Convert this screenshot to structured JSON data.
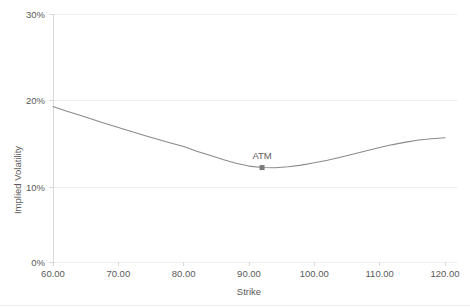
{
  "chart_data": {
    "type": "line",
    "title": "",
    "xlabel": "Strike",
    "ylabel": "Implied Volatility",
    "xlim": [
      60,
      120
    ],
    "ylim": [
      0,
      0.3
    ],
    "grid": true,
    "legend": "none",
    "x_tick_labels": [
      "60.00",
      "70.00",
      "80.00",
      "90.00",
      "100.00",
      "110.00",
      "120.00"
    ],
    "x_tick_values": [
      60,
      70,
      80,
      90,
      100,
      110,
      120
    ],
    "y_tick_labels": [
      "0%",
      "10%",
      "20%",
      "30%"
    ],
    "y_tick_values": [
      0,
      0.1,
      0.2,
      0.3
    ],
    "series": [
      {
        "name": "Implied Volatility Smile",
        "x": [
          60,
          62,
          64,
          66,
          68,
          70,
          72,
          74,
          76,
          78,
          80,
          82,
          84,
          86,
          88,
          90,
          92,
          94,
          96,
          98,
          100,
          102,
          104,
          106,
          108,
          110,
          112,
          114,
          116,
          118,
          120
        ],
        "values": [
          0.188,
          0.1828,
          0.1777,
          0.1726,
          0.1676,
          0.1627,
          0.1578,
          0.153,
          0.1484,
          0.144,
          0.1396,
          0.134,
          0.129,
          0.124,
          0.1195,
          0.116,
          0.1142,
          0.114,
          0.1152,
          0.1172,
          0.12,
          0.1232,
          0.1268,
          0.1306,
          0.1345,
          0.1384,
          0.142,
          0.145,
          0.1475,
          0.1492,
          0.1503
        ]
      }
    ],
    "annotations": [
      {
        "label": "ATM",
        "x": 92,
        "y": 0.1142,
        "marker": "square"
      }
    ]
  },
  "axes": {
    "y_title": "Implied Volatility",
    "x_title": "Strike",
    "y_labels": {
      "t0": "0%",
      "t1": "10%",
      "t2": "20%",
      "t3": "30%"
    },
    "x_labels": {
      "t0": "60.00",
      "t1": "70.00",
      "t2": "80.00",
      "t3": "90.00",
      "t4": "100.00",
      "t5": "110.00",
      "t6": "120.00"
    }
  },
  "annotation": {
    "atm_label": "ATM"
  },
  "colors": {
    "line": "#8a8a8a",
    "grid": "#e8e8e8",
    "axis": "#d0d0d0",
    "text": "#5a5a5a",
    "marker": "#7a7a7a",
    "background": "#ffffff"
  }
}
